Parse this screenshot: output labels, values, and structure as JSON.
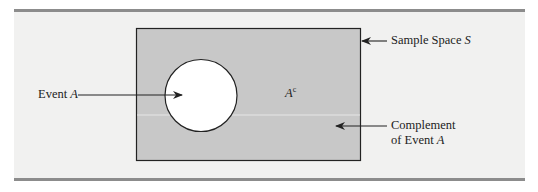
{
  "diagram": {
    "type": "venn-complement",
    "sample_space": {
      "label_text": "Sample Space ",
      "label_var": "S"
    },
    "event": {
      "label_text": "Event ",
      "label_var": "A"
    },
    "complement_region": {
      "label_var": "A",
      "label_sup": "c"
    },
    "complement_callout": {
      "line1": "Complement",
      "line2_text": "of Event ",
      "line2_var": "A"
    },
    "colors": {
      "sample_space_fill": "#c8c8c8",
      "event_fill": "#ffffff",
      "outline": "#222222",
      "rule": "#8c8c8c",
      "background": "#f1f1f0"
    }
  }
}
